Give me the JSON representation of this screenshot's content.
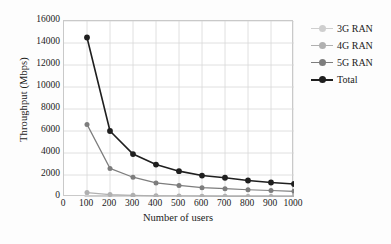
{
  "chart_data": {
    "type": "line",
    "title": "",
    "xlabel": "Number of users",
    "ylabel": "Throughput (Mbps)",
    "x": [
      100,
      200,
      300,
      400,
      500,
      600,
      700,
      800,
      900,
      1000
    ],
    "xticks": [
      0,
      100,
      200,
      300,
      400,
      500,
      600,
      700,
      800,
      900,
      1000
    ],
    "yticks": [
      0,
      2000,
      4000,
      6000,
      8000,
      10000,
      12000,
      14000,
      16000
    ],
    "xlim": [
      0,
      1000
    ],
    "ylim": [
      0,
      16000
    ],
    "grid": true,
    "legend_position": "right",
    "series": [
      {
        "name": "3G RAN",
        "color": "#cfcfcf",
        "values": [
          60,
          30,
          20,
          15,
          12,
          10,
          9,
          8,
          7,
          6
        ]
      },
      {
        "name": "4G RAN",
        "color": "#b0b0b0",
        "values": [
          400,
          220,
          150,
          110,
          90,
          75,
          65,
          55,
          50,
          45
        ]
      },
      {
        "name": "5G RAN",
        "color": "#7d7d7d",
        "values": [
          6600,
          2600,
          1800,
          1280,
          1050,
          850,
          760,
          660,
          590,
          520
        ]
      },
      {
        "name": "Total",
        "color": "#1f1f1f",
        "values": [
          14500,
          6000,
          3900,
          2950,
          2350,
          1950,
          1750,
          1500,
          1320,
          1180
        ]
      }
    ]
  },
  "legend": {
    "entries": [
      "3G RAN",
      "4G RAN",
      "5G RAN",
      "Total"
    ]
  },
  "colors": {
    "grid": "#d8d8d8",
    "frame": "#c9c9c9",
    "text": "#222222",
    "background": "#fdfdfd"
  }
}
